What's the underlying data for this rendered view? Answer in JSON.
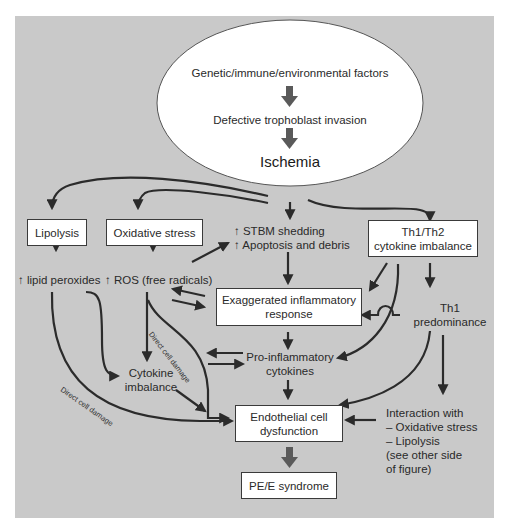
{
  "ellipse": {
    "line1": "Genetic/immune/environmental factors",
    "line2": "Defective trophoblast invasion",
    "line3": "Ischemia"
  },
  "boxes": {
    "lipolysis": "Lipolysis",
    "oxidative_stress": "Oxidative stress",
    "th1th2_line1": "Th1/Th2",
    "th1th2_line2": "cytokine imbalance",
    "exaggerated_line1": "Exaggerated inflammatory",
    "exaggerated_line2": "response",
    "endothelial_line1": "Endothelial cell",
    "endothelial_line2": "dysfunction",
    "pe_syndrome": "PE/E syndrome"
  },
  "labels": {
    "stbm_line1": "↑ STBM shedding",
    "stbm_line2": "↑ Apoptosis and debris",
    "lipid_peroxides": "↑ lipid peroxides",
    "ros": "↑ ROS (free radicals)",
    "th1_line1": "Th1",
    "th1_line2": "predominance",
    "proinflam_line1": "Pro-inflammatory",
    "proinflam_line2": "cytokines",
    "cytokine_imb_line1": "Cytokine",
    "cytokine_imb_line2": "imbalance",
    "interaction_line1": "Interaction with",
    "interaction_line2": "– Oxidative stress",
    "interaction_line3": "– Lipolysis",
    "interaction_line4": "(see other side",
    "interaction_line5": "of figure)",
    "direct_damage_1": "Direct cell damage",
    "direct_damage_2": "Direct cell damage"
  },
  "colors": {
    "panel": "#c9c9c9",
    "arrow": "#2b2b2b",
    "thick_arrow": "#5a5a5a",
    "box_fill": "#ffffff"
  }
}
